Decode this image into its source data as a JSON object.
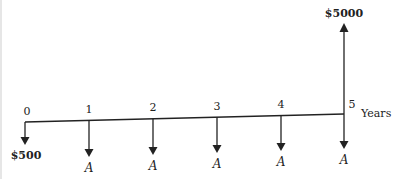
{
  "diagram": {
    "type": "cash-flow-diagram",
    "axis_unit_label": "Years",
    "periods": [
      {
        "label": "0",
        "x": 25,
        "y": 122,
        "flow": "down",
        "amount_label": "$500",
        "length": 22
      },
      {
        "label": "1",
        "x": 89,
        "y": 120.4,
        "flow": "down",
        "amount_label": "A",
        "length": 36
      },
      {
        "label": "2",
        "x": 153,
        "y": 118.8,
        "flow": "down",
        "amount_label": "A",
        "length": 36
      },
      {
        "label": "3",
        "x": 217,
        "y": 117.2,
        "flow": "down",
        "amount_label": "A",
        "length": 36
      },
      {
        "label": "4",
        "x": 281,
        "y": 115.6,
        "flow": "down",
        "amount_label": "A",
        "length": 36
      },
      {
        "label": "5",
        "x": 344,
        "y": 114,
        "flow": "down",
        "amount_label": "A",
        "length": 35
      }
    ],
    "receipt": {
      "period": "5",
      "label": "$5000",
      "direction": "up"
    },
    "colors": {
      "ink": "#222222",
      "background": "#ffffff"
    }
  }
}
